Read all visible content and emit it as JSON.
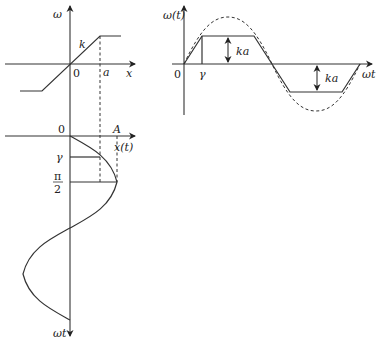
{
  "panels": {
    "characteristic": {
      "y_axis_label": "ω",
      "x_axis_label": "x",
      "origin_label": "0",
      "slope_label": "k",
      "saturation_label": "a"
    },
    "response": {
      "y_axis_label": "ω(t)",
      "x_axis_label": "ωt",
      "origin_label": "0",
      "gamma_label": "γ",
      "amplitude_label_top": "ka",
      "amplitude_label_bottom": "ka"
    },
    "input": {
      "origin_label": "0",
      "amplitude_label": "A",
      "x_axis_label": "x(t)",
      "gamma_label": "γ",
      "pi_label": "π",
      "two_label": "2",
      "time_axis_label": "ωt"
    }
  },
  "colors": {
    "line": "#333333",
    "background": "#ffffff"
  }
}
